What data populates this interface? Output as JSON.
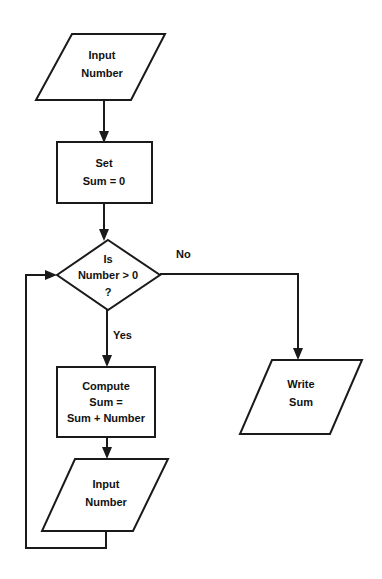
{
  "diagram": {
    "type": "flowchart",
    "stroke_color": "#1a1a1a",
    "fill_color": "#ffffff",
    "text_color": "#111111",
    "background": "#ffffff"
  },
  "nodes": {
    "input_number_top": {
      "shape": "parallelogram",
      "role": "input",
      "line1": "Input",
      "line2": "Number"
    },
    "set_sum": {
      "shape": "rectangle",
      "role": "process",
      "line1": "Set",
      "line2": "Sum = 0"
    },
    "decision": {
      "shape": "diamond",
      "role": "decision",
      "line1": "Is",
      "line2": "Number > 0",
      "line3": "?"
    },
    "compute_sum": {
      "shape": "rectangle",
      "role": "process",
      "line1": "Compute",
      "line2": "Sum =",
      "line3": "Sum + Number"
    },
    "input_number_bottom": {
      "shape": "parallelogram",
      "role": "input",
      "line1": "Input",
      "line2": "Number"
    },
    "write_sum": {
      "shape": "parallelogram",
      "role": "output",
      "line1": "Write",
      "line2": "Sum"
    }
  },
  "branch_labels": {
    "yes": "Yes",
    "no": "No"
  },
  "edges": [
    {
      "from": "input_number_top",
      "to": "set_sum",
      "label": ""
    },
    {
      "from": "set_sum",
      "to": "decision",
      "label": ""
    },
    {
      "from": "decision",
      "to": "compute_sum",
      "label": "Yes"
    },
    {
      "from": "decision",
      "to": "write_sum",
      "label": "No"
    },
    {
      "from": "compute_sum",
      "to": "input_number_bottom",
      "label": ""
    },
    {
      "from": "input_number_bottom",
      "to": "decision",
      "label": ""
    }
  ]
}
